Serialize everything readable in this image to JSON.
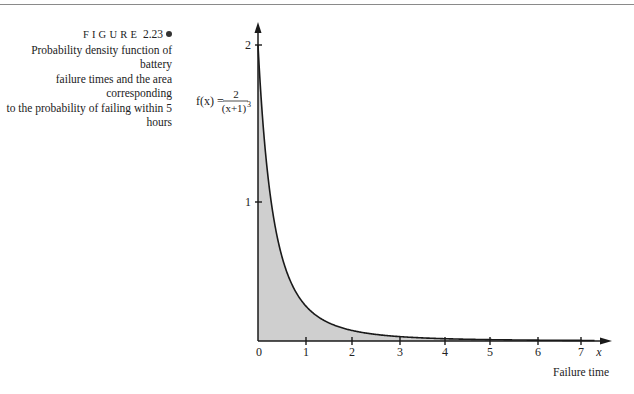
{
  "caption": {
    "figure_label": "FIGURE",
    "figure_number": "2.23",
    "text_lines": [
      "Probability density function of battery",
      "failure times and the area corresponding",
      "to the probability of failing within 5",
      "hours"
    ]
  },
  "formula": {
    "lhs": "f(x) =",
    "numerator": "2",
    "denominator": "(x+1)",
    "exponent": "3"
  },
  "chart_data": {
    "type": "area",
    "title": "Probability density function of battery failure times",
    "function": "f(x) = 2/(x+1)^3",
    "xlabel": "Failure time",
    "x_axis_symbol": "x",
    "ylabel": "",
    "x_ticks": [
      "0",
      "1",
      "2",
      "3",
      "4",
      "5",
      "6",
      "7"
    ],
    "y_ticks": [
      "1",
      "2"
    ],
    "xlim": [
      0,
      7.4
    ],
    "ylim": [
      0,
      2.1
    ],
    "shaded_interval": [
      0,
      5
    ],
    "shade_color": "#cfcfcf",
    "grid": false,
    "x": [
      0,
      0.25,
      0.5,
      1,
      1.5,
      2,
      3,
      4,
      5,
      6,
      7
    ],
    "values": [
      2.0,
      1.024,
      0.593,
      0.25,
      0.128,
      0.074,
      0.031,
      0.016,
      0.009,
      0.006,
      0.004
    ]
  }
}
